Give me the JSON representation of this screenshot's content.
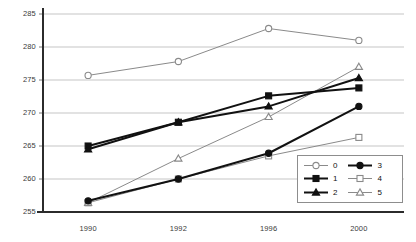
{
  "chart_data": {
    "type": "line",
    "title": "",
    "xlabel": "",
    "ylabel": "",
    "categories": [
      "1990",
      "1992",
      "1996",
      "2000"
    ],
    "x": [
      1990,
      1992,
      1996,
      2000
    ],
    "ylim": [
      255,
      285
    ],
    "yticks": [
      255,
      260,
      265,
      270,
      275,
      280,
      285
    ],
    "ytick_labels": [
      "255",
      "260",
      "265",
      "270",
      "275",
      "280",
      "285"
    ],
    "grid": true,
    "grid_axis": "y",
    "legend_position": "lower-right",
    "series": [
      {
        "name": "0",
        "values": [
          275.7,
          277.8,
          282.8,
          281.0
        ],
        "marker": "open-circle",
        "color": "#8a8a8a",
        "line_width": 1.0,
        "filled": false
      },
      {
        "name": "1",
        "values": [
          265.0,
          268.6,
          272.6,
          273.8
        ],
        "marker": "filled-square",
        "color": "#111111",
        "line_width": 2.0,
        "filled": true
      },
      {
        "name": "2",
        "values": [
          264.5,
          268.6,
          271.0,
          275.3
        ],
        "marker": "filled-triangle",
        "color": "#111111",
        "line_width": 2.0,
        "filled": true
      },
      {
        "name": "3",
        "values": [
          256.7,
          260.0,
          263.9,
          271.0
        ],
        "marker": "filled-circle",
        "color": "#111111",
        "line_width": 2.0,
        "filled": true
      },
      {
        "name": "4",
        "values": [
          256.4,
          260.0,
          263.5,
          266.3
        ],
        "marker": "open-square",
        "color": "#8a8a8a",
        "line_width": 1.0,
        "filled": false
      },
      {
        "name": "5",
        "values": [
          256.4,
          263.1,
          269.4,
          277.0
        ],
        "marker": "open-triangle",
        "color": "#8a8a8a",
        "line_width": 1.0,
        "filled": false
      }
    ]
  },
  "legend": {
    "columns": [
      {
        "entries": [
          "0",
          "1",
          "2"
        ]
      },
      {
        "entries": [
          "3",
          "4",
          "5"
        ]
      }
    ]
  }
}
